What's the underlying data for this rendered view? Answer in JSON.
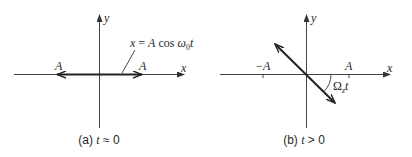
{
  "panels": [
    {
      "id": "a",
      "caption_prefix": "(a) ",
      "caption_var": "t",
      "caption_rel": " ≈ 0",
      "axis_labels": {
        "x": "x",
        "y": "y"
      },
      "left_label": "A",
      "right_label": "A",
      "formula": {
        "lhs": "x",
        "eq": " = ",
        "amp": "A",
        "func": " cos ",
        "omega": "ω",
        "sub": "0",
        "var": "t"
      }
    },
    {
      "id": "b",
      "caption_prefix": "(b) ",
      "caption_var": "t",
      "caption_rel": " > 0",
      "axis_labels": {
        "x": "x",
        "y": "y"
      },
      "neg_label": "−A",
      "pos_label": "A",
      "angle_label": {
        "symbol": "Ω",
        "sub": "z",
        "var": "t"
      }
    }
  ],
  "colors": {
    "axis": "#444444",
    "vector": "#222222",
    "text": "#2a2a2a",
    "background": "#ffffff"
  }
}
